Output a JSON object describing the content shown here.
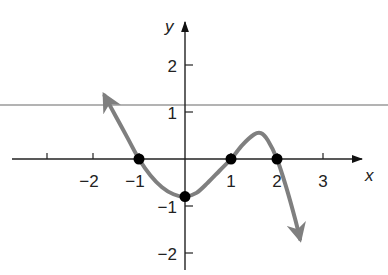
{
  "chart_data": {
    "type": "line",
    "title": "",
    "xlabel": "x",
    "ylabel": "y",
    "xlim": [
      -3.8,
      4.4
    ],
    "ylim": [
      -2.4,
      3.1
    ],
    "grid": false,
    "legend": null,
    "x_ticks": [
      -3,
      -2,
      -1,
      1,
      2,
      3
    ],
    "x_tick_labels": [
      {
        "value": -2,
        "label": "−2"
      },
      {
        "value": -1,
        "label": "−1"
      },
      {
        "value": 1,
        "label": "1"
      },
      {
        "value": 2,
        "label": "2"
      },
      {
        "value": 3,
        "label": "3"
      }
    ],
    "y_ticks": [
      -2,
      -1,
      1,
      2
    ],
    "y_tick_labels": [
      {
        "value": 2,
        "label": "2"
      },
      {
        "value": 1,
        "label": "1"
      },
      {
        "value": -1,
        "label": "−1"
      },
      {
        "value": -2,
        "label": "−2"
      }
    ],
    "horizontal_line": {
      "y": 1.15,
      "color": "#9a9a9a"
    },
    "series": [
      {
        "name": "f(x)",
        "color": "#7f7f7f",
        "arrows_at_ends": true,
        "x": [
          -1.75,
          -1.5,
          -1.25,
          -1.0,
          -0.75,
          -0.5,
          -0.25,
          0.0,
          0.25,
          0.5,
          0.75,
          1.0,
          1.25,
          1.5,
          1.65,
          1.8,
          2.0,
          2.2,
          2.4,
          2.5
        ],
        "y": [
          1.35,
          0.9,
          0.45,
          0.0,
          -0.35,
          -0.6,
          -0.75,
          -0.8,
          -0.72,
          -0.5,
          -0.25,
          0.0,
          0.3,
          0.52,
          0.55,
          0.4,
          0.0,
          -0.6,
          -1.3,
          -1.7
        ]
      }
    ],
    "marked_points": [
      {
        "x": -1,
        "y": 0
      },
      {
        "x": 0,
        "y": -0.8
      },
      {
        "x": 1,
        "y": 0
      },
      {
        "x": 2,
        "y": 0
      }
    ]
  },
  "labels": {
    "x_axis": "x",
    "y_axis": "y",
    "x_ticks": [
      "−2",
      "−1",
      "1",
      "2",
      "3"
    ],
    "y_ticks": [
      "2",
      "1",
      "−1",
      "−2"
    ]
  }
}
